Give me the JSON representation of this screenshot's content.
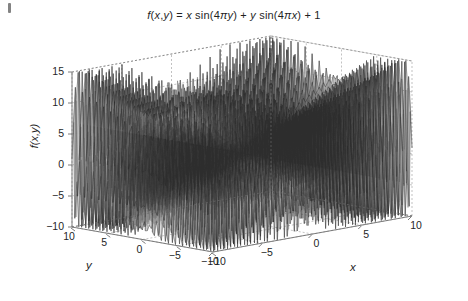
{
  "figure": {
    "title_plain": "f(x,y) = x sin(4πy) + y sin(4πx) + 1",
    "title_parts": {
      "f": "f",
      "open": "(",
      "x1": "x",
      "comma": ",",
      "y1": "y",
      "close": ")",
      "eq": " = ",
      "x2": "x",
      "sin1": " sin(4",
      "pi1": "π",
      "y2": "y",
      "p1": ") + ",
      "y3": "y",
      "sin2": " sin(4",
      "pi2": "π",
      "x3": "x",
      "p2": ") + 1"
    },
    "background_color": "#ffffff",
    "mesh_line_color": "#2a2a2a",
    "axis_color": "#6e6e6e",
    "grid_color": "#9a9a9a",
    "text_color": "#1f1f1f"
  },
  "axes": {
    "z": {
      "label": "f(x,y)",
      "ticks": [
        "15",
        "10",
        "5",
        "0",
        "-5",
        "-10"
      ],
      "tick_values": [
        15,
        10,
        5,
        0,
        -5,
        -10
      ],
      "range": [
        -10,
        15
      ]
    },
    "y": {
      "label": "y",
      "ticks": [
        "10",
        "5",
        "0",
        "-5",
        "-10"
      ],
      "tick_values": [
        10,
        5,
        0,
        -5,
        -10
      ],
      "range": [
        -10,
        10
      ]
    },
    "x": {
      "label": "x",
      "ticks": [
        "-10",
        "-5",
        "0",
        "5",
        "10"
      ],
      "tick_values": [
        -10,
        -5,
        0,
        5,
        10
      ],
      "range": [
        -10,
        10
      ]
    }
  },
  "chart_data": {
    "type": "line",
    "plot_style": "3d-mesh-surface",
    "title": "f(x,y) = x sin(4πy) + y sin(4πx) + 1",
    "xlabel": "x",
    "ylabel": "y",
    "zlabel": "f(x,y)",
    "formula": "x*sin(4*pi*y) + y*sin(4*pi*x) + 1",
    "xlim": [
      -10,
      10
    ],
    "ylim": [
      -10,
      10
    ],
    "zlim": [
      -10,
      15
    ],
    "xticks": [
      -10,
      -5,
      0,
      5,
      10
    ],
    "yticks": [
      -10,
      -5,
      0,
      5,
      10
    ],
    "zticks": [
      -10,
      -5,
      0,
      5,
      10,
      15
    ],
    "grid": true,
    "legend": "none",
    "colormap": "grayscale",
    "grid_samples": 121,
    "view_azimuth": -37.5,
    "view_elevation": 30,
    "x_increases_to": "right",
    "y_increases_to": "left",
    "z_min_observed": -10,
    "z_max_observed": 15,
    "series": [
      {
        "name": "f(x,y)",
        "surface_samples_x": [
          -10,
          -7.5,
          -5,
          -2.5,
          0,
          2.5,
          5,
          7.5,
          10
        ],
        "surface_samples_y": [
          -10,
          -7.5,
          -5,
          -2.5,
          0,
          2.5,
          5,
          7.5,
          10
        ],
        "sample_values_at_y0": [
          1,
          1,
          1,
          1,
          1,
          1,
          1,
          1,
          1
        ],
        "envelope_upper": [
          15,
          13,
          9,
          5,
          1,
          5,
          9,
          13,
          15
        ],
        "envelope_lower": [
          -10,
          -9,
          -7,
          -3,
          1,
          -3,
          -7,
          -9,
          -10
        ]
      }
    ]
  }
}
